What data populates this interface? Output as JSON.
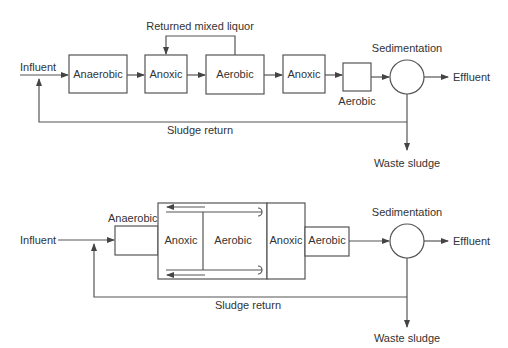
{
  "top": {
    "influent": "Influent",
    "anaerobic": "Anaerobic",
    "anoxic1": "Anoxic",
    "aerobic1": "Aerobic",
    "anoxic2": "Anoxic",
    "aerobic2": "Aerobic",
    "sedimentation": "Sedimentation",
    "effluent": "Effluent",
    "returned_mixed_liquor": "Returned mixed liquor",
    "sludge_return": "Sludge return",
    "waste_sludge": "Waste sludge"
  },
  "bottom": {
    "influent": "Influent",
    "anaerobic": "Anaerobic",
    "anoxic1": "Anoxic",
    "aerobic1": "Aerobic",
    "anoxic2": "Anoxic",
    "aerobic2": "Aerobic",
    "sedimentation": "Sedimentation",
    "effluent": "Effluent",
    "sludge_return": "Sludge return",
    "waste_sludge": "Waste sludge"
  }
}
